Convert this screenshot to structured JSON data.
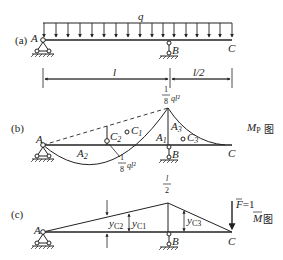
{
  "figure": {
    "panels": [
      {
        "id": "a",
        "label": "(a)",
        "load": "q",
        "points": {
          "A": "A",
          "B": "B",
          "C": "C"
        },
        "dimensions": {
          "AB": "l",
          "BC": "l/2"
        }
      },
      {
        "id": "b",
        "label": "(b)",
        "diagram_name_main": "M",
        "diagram_name_sub": "P",
        "diagram_name_suffix": "图",
        "peak_value_num": "1",
        "peak_value_den": "8",
        "peak_value_expr": "ql²",
        "mid_value_num": "1",
        "mid_value_den": "8",
        "mid_value_expr": "ql²",
        "areas": {
          "A1": "A",
          "A1_sub": "1",
          "A2": "A",
          "A2_sub": "2",
          "A3": "A",
          "A3_sub": "3"
        },
        "centroids": {
          "C1": "C",
          "C1_sub": "1",
          "C2": "C",
          "C2_sub": "2",
          "C3": "C",
          "C3_sub": "3"
        },
        "points": {
          "A": "A",
          "B": "B",
          "C": "C"
        }
      },
      {
        "id": "c",
        "label": "(c)",
        "diagram_name_main": "M",
        "diagram_name_suffix": "图",
        "peak_value_num": "l",
        "peak_value_den": "2",
        "force_label": "F",
        "force_value": "=1",
        "ordinates": {
          "yC1": "y",
          "yC1_sub": "C1",
          "yC2": "y",
          "yC2_sub": "C2",
          "yC3": "y",
          "yC3_sub": "C3"
        },
        "points": {
          "A": "A",
          "B": "B",
          "C": "C"
        }
      }
    ]
  }
}
